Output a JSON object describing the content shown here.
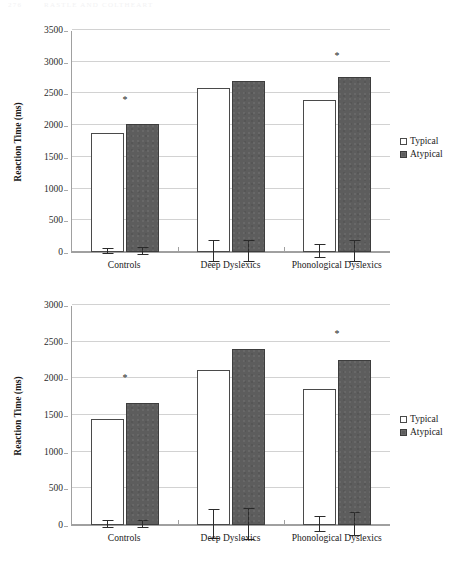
{
  "page_header": {
    "page_number": "276",
    "running_head": "RASTLE AND COLTHEART"
  },
  "legend": {
    "typical_label": "Typical",
    "atypical_label": "Atypical",
    "typical_swatch_icon": "hollow-square-icon",
    "atypical_swatch_icon": "filled-square-icon",
    "typical_color": "#ffffff",
    "atypical_color": "#5d5d5d"
  },
  "chart_data": [
    {
      "id": "top",
      "type": "bar",
      "title": "",
      "xlabel": "",
      "ylabel": "Reaction Time (ms)",
      "ylim": [
        0,
        3500
      ],
      "ytick_step": 500,
      "yticks": [
        "0",
        "500",
        "1000",
        "1500",
        "2000",
        "2500",
        "3000",
        "3500"
      ],
      "grid": "horizontal",
      "legend_position": "right",
      "categories": [
        "Controls",
        "Deep Dyslexics",
        "Phonological Dyslexics"
      ],
      "series": [
        {
          "name": "Typical",
          "values": [
            1880,
            2580,
            2400
          ],
          "errors": [
            40,
            175,
            110
          ]
        },
        {
          "name": "Atypical",
          "values": [
            2020,
            2700,
            2760
          ],
          "errors": [
            70,
            175,
            175
          ]
        }
      ],
      "significance_markers": [
        {
          "category": "Controls",
          "symbol": "*",
          "y": 2320
        },
        {
          "category": "Phonological Dyslexics",
          "symbol": "*",
          "y": 3010
        }
      ]
    },
    {
      "id": "bottom",
      "type": "bar",
      "title": "",
      "xlabel": "",
      "ylabel": "Reaction Time (ms)",
      "ylim": [
        0,
        3000
      ],
      "ytick_step": 500,
      "yticks": [
        "0",
        "500",
        "1000",
        "1500",
        "2000",
        "2500",
        "3000"
      ],
      "grid": "horizontal",
      "legend_position": "right",
      "categories": [
        "Controls",
        "Deep Dyslexics",
        "Phonological Dyslexics"
      ],
      "series": [
        {
          "name": "Typical",
          "values": [
            1440,
            2120,
            1850
          ],
          "errors": [
            55,
            200,
            115
          ]
        },
        {
          "name": "Atypical",
          "values": [
            1660,
            2400,
            2250
          ],
          "errors": [
            60,
            215,
            165
          ]
        }
      ],
      "significance_markers": [
        {
          "category": "Controls",
          "symbol": "*",
          "y": 1935
        },
        {
          "category": "Phonological Dyslexics",
          "symbol": "*",
          "y": 2530
        }
      ]
    }
  ]
}
